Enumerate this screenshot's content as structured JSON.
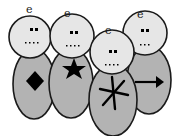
{
  "figures": [
    {
      "label": "e",
      "symbol": "diamond"
    },
    {
      "label": "e",
      "symbol": "star"
    },
    {
      "label": "e",
      "symbol": "asterisk"
    },
    {
      "label": "e",
      "symbol": "arrow-right"
    }
  ],
  "colors": {
    "body": "#b3b3b3",
    "head": "#e6e6e6",
    "outline": "#1a1a1a",
    "symbol": "#000000"
  }
}
